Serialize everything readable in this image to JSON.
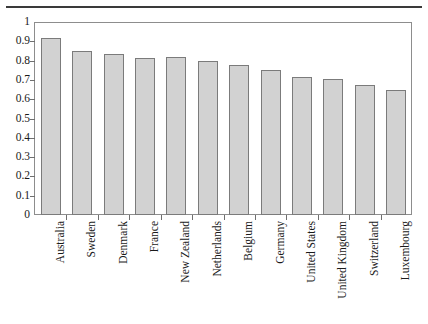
{
  "figure": {
    "background_color": "#ffffff",
    "rule_color": "#3a3a3a",
    "frame_color": "#8d8d8d"
  },
  "chart_data": {
    "type": "bar",
    "title": "",
    "subtitle": "",
    "xlabel": "",
    "ylabel": "",
    "ylim": [
      0,
      1
    ],
    "yticks": [
      0,
      0.1,
      0.2,
      0.3,
      0.4,
      0.5,
      0.6,
      0.7,
      0.8,
      0.9,
      1
    ],
    "ytick_labels": [
      "0",
      "0.1",
      "0.2",
      "0.3",
      "0.4",
      "0.5",
      "0.6",
      "0.7",
      "0.8",
      "0.9",
      "1"
    ],
    "grid": false,
    "legend": null,
    "bar_fill_color": "#d2d2d2",
    "bar_edge_color": "#7b7b7b",
    "categories": [
      "Australia",
      "Sweden",
      "Denmark",
      "France",
      "New Zealand",
      "Netherlands",
      "Belgium",
      "Germany",
      "United States",
      "United Kingdom",
      "Switzerland",
      "Luxembourg"
    ],
    "values": [
      0.915,
      0.85,
      0.835,
      0.815,
      0.82,
      0.8,
      0.775,
      0.75,
      0.715,
      0.705,
      0.675,
      0.65
    ]
  }
}
